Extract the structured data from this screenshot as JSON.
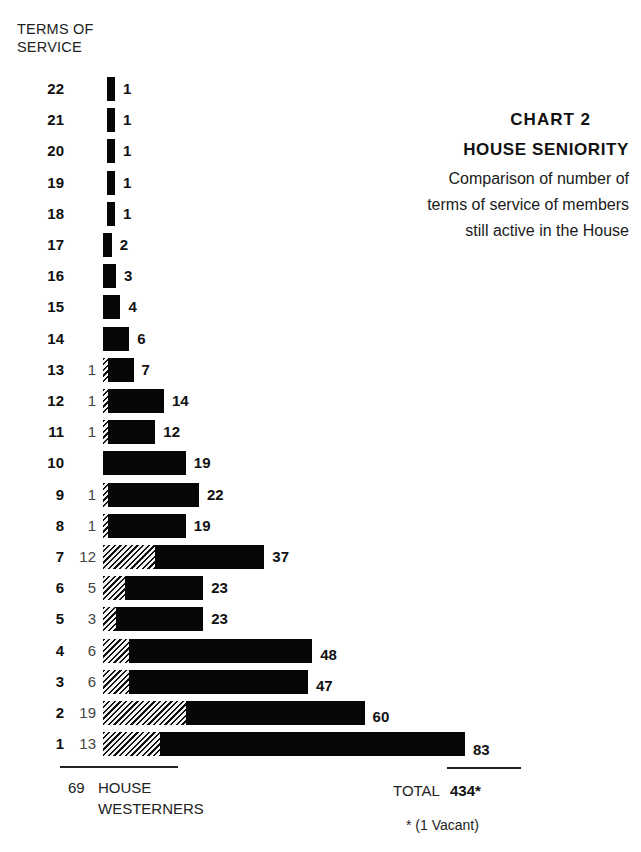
{
  "chart_data": {
    "type": "bar",
    "orientation": "horizontal",
    "stacked": true,
    "title": "CHART 2",
    "subtitle": "HOUSE SENIORITY",
    "description": [
      "Comparison of number of",
      "terms of service of members",
      "still active in the House"
    ],
    "ylabel": [
      "TERMS OF",
      "SERVICE"
    ],
    "categories": [
      "22",
      "21",
      "20",
      "19",
      "18",
      "17",
      "16",
      "15",
      "14",
      "13",
      "12",
      "11",
      "10",
      "9",
      "8",
      "7",
      "6",
      "5",
      "4",
      "3",
      "2",
      "1"
    ],
    "series": [
      {
        "name": "House Westerners",
        "pattern": "hatched",
        "values": [
          0,
          0,
          0,
          0,
          0,
          0,
          0,
          0,
          0,
          1,
          1,
          1,
          0,
          1,
          1,
          12,
          5,
          3,
          6,
          6,
          19,
          13
        ],
        "labels": [
          "",
          "",
          "",
          "",
          "",
          "",
          "",
          "",
          "",
          "1",
          "1",
          "1",
          "",
          "1",
          "1",
          "12",
          "5",
          "3",
          "6",
          "6",
          "19",
          "13"
        ]
      },
      {
        "name": "Total members",
        "pattern": "solid",
        "values": [
          1,
          1,
          1,
          1,
          1,
          2,
          3,
          4,
          6,
          7,
          14,
          12,
          19,
          22,
          19,
          37,
          23,
          23,
          48,
          47,
          60,
          83
        ]
      }
    ],
    "totals": {
      "westerners": 69,
      "westerners_label": [
        "HOUSE",
        "WESTERNERS"
      ],
      "total_label": "TOTAL",
      "total": "434*",
      "footnote": "* (1 Vacant)"
    },
    "xlim": [
      0,
      85
    ],
    "grid": false,
    "legend": "none"
  },
  "px_per_unit": 4.36
}
